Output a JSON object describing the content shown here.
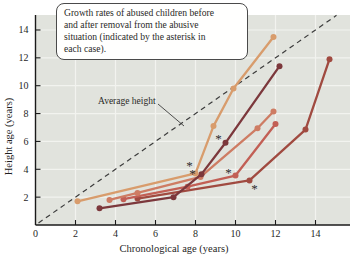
{
  "figure": {
    "annotation": {
      "lines": [
        "Growth rates of abused children before",
        "and after removal from the abusive",
        "situation (indicated by the asterisk in",
        "each case)."
      ]
    }
  },
  "chart_data": {
    "type": "line",
    "title": "",
    "xlabel": "Chronological age (years)",
    "ylabel": "Height age (years)",
    "xlim": [
      0,
      15.7
    ],
    "ylim": [
      0,
      15.1
    ],
    "x_ticks": [
      0,
      2,
      4,
      6,
      8,
      10,
      12,
      14
    ],
    "y_ticks": [
      2,
      4,
      6,
      8,
      10,
      12,
      14
    ],
    "grid": true,
    "reference_line": {
      "label": "Average height",
      "style": "dashed",
      "from": [
        0.15,
        0.15
      ],
      "to": [
        15.05,
        15.05
      ]
    },
    "series": [
      {
        "name": "child-5",
        "color": "#a04a40",
        "points": [
          [
            5.1,
            1.9
          ],
          [
            10.7,
            3.2
          ],
          [
            13.5,
            6.85
          ],
          [
            14.7,
            11.9
          ]
        ],
        "removal_asterisk": [
          10.95,
          2.6
        ]
      },
      {
        "name": "child-3",
        "color": "#c25f55",
        "points": [
          [
            4.4,
            1.85
          ],
          [
            7.6,
            2.75
          ],
          [
            10.0,
            3.55
          ],
          [
            12.0,
            7.25
          ]
        ],
        "removal_asterisk": [
          9.65,
          3.8
        ]
      },
      {
        "name": "child-2",
        "color": "#ce7c63",
        "points": [
          [
            3.7,
            1.8
          ],
          [
            5.1,
            2.3
          ],
          [
            8.25,
            3.45
          ],
          [
            11.1,
            6.95
          ],
          [
            11.9,
            8.15
          ]
        ],
        "removal_asterisk": [
          7.85,
          3.7
        ]
      },
      {
        "name": "child-4",
        "color": "#7c383c",
        "points": [
          [
            3.2,
            1.2
          ],
          [
            6.9,
            2.0
          ],
          [
            8.3,
            3.65
          ],
          [
            9.5,
            5.9
          ],
          [
            12.2,
            11.4
          ]
        ],
        "removal_asterisk": [
          9.15,
          6.2
        ]
      },
      {
        "name": "child-1",
        "color": "#d89c6c",
        "points": [
          [
            2.1,
            1.7
          ],
          [
            8.0,
            3.7
          ],
          [
            8.9,
            7.1
          ],
          [
            9.9,
            9.8
          ],
          [
            11.9,
            13.5
          ]
        ],
        "removal_asterisk": [
          7.7,
          4.3
        ]
      }
    ],
    "colors": {
      "panel_bg": "#e1e3dd",
      "grid": "#f2f3ef",
      "axis": "#1a1a1a",
      "dashed_line": "#3c3c3c",
      "asterisk": "#2e2e2e",
      "text": "#1f1f1f"
    }
  }
}
